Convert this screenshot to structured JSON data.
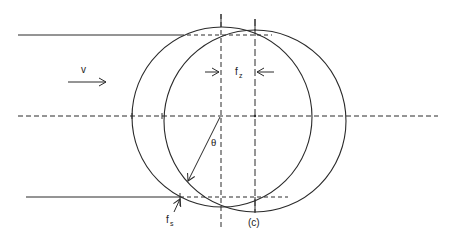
{
  "diagram": {
    "type": "geometry-schematic",
    "colors": {
      "stroke": "#2a2a2a",
      "background": "#ffffff"
    },
    "labels": {
      "velocity": "v",
      "feed_z_main": "f",
      "feed_z_sub": "z",
      "feed_s_main": "f",
      "feed_s_sub": "s",
      "angle": "θ",
      "figure_tag": "(c)"
    },
    "circles": [
      {
        "name": "left-circle",
        "cx": 222,
        "cy": 117,
        "r": 90
      },
      {
        "name": "right-circle",
        "cx": 255,
        "cy": 121,
        "r": 91
      }
    ],
    "center_line_y": 116,
    "vertical_axes_x": [
      221,
      255
    ],
    "top_line_y": 35,
    "bottom_line_y": 197
  }
}
